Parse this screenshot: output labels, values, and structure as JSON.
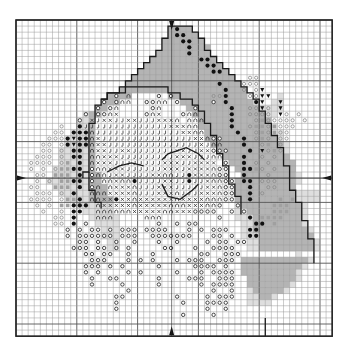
{
  "chart": {
    "cols": 52,
    "rows": 52,
    "origin_x": 16,
    "origin_y": 20,
    "cell": 6.08,
    "center_col": 25.6,
    "center_row": 26,
    "colors": {
      "background": "#ffffff",
      "grid_line": "#9a9a9a",
      "grid_major": "#555555",
      "border": "#222222",
      "dark_fill": "#b4b4b4",
      "light_fill": "#dedede",
      "symbol": "#333333",
      "light_symbol": "#8a8a8a",
      "outline": "#1a1a1a"
    },
    "legend_symbols": [
      {
        "key": "o",
        "name": "circle-stitch"
      },
      {
        "key": "n",
        "name": "arch-stitch"
      },
      {
        "key": "x",
        "name": "cross-stitch"
      },
      {
        "key": "j",
        "name": "hook-stitch"
      },
      {
        "key": "*",
        "name": "filled-dot-stitch"
      },
      {
        "key": "v",
        "name": "triangle-stitch"
      },
      {
        "key": "s",
        "name": "light-circle-stitch"
      },
      {
        "key": "q",
        "name": "grey-square-stitch"
      }
    ],
    "fill_rows": [
      "....................................................",
      ".........................GGGG.......................",
      ".........................GGGGG......................",
      "........................GGGGGGG.....................",
      "........................GGGGGGGG....................",
      ".......................GGGGGGGGG....................",
      "......................GGGGGGGGGGG...................",
      ".....................GGGGGGGGGGGGG..................",
      "....................GGGGGGGGGGGGGGG.................",
      "...................GGGGGGGGGGGGGGGGG................",
      "..................GGGGGGGGGGGGGGGGGGG...............",
      ".................GGGGGGGGGGGGGGGGGGGGG..............",
      "...............GGGG......GGGGGGGGGGGGG.....g........",
      "..............GGG..........GGGGGGGGGGGGg..gg........",
      ".............GG.............GGGGGGGGGGGGgggg........",
      "...........gGG...............GGGGGGGGGGGGgg.........",
      "..........ggG.................GGGGGGGGGGGG..........",
      "..........ggG.................GGGGGGGGGGGGg.........",
      ".........gggG..................GGGGGGGGGGGgg........",
      "........ggggG..................GGGGGGGGGGGGg........",
      "........ggggG...................GGGGGGGGGGGGg.......",
      ".......gggggG....................GGGGGGGGGGGg.......",
      ".......gggggG.....................GGGGGGGGGGG.......",
      ".......gggggG......................GGGGGGGGGGG......",
      "......ggggggG.......................GGGGGGGGGG......",
      "......ggggggGG.......................GGGGGGGGGg.....",
      ".....gggggggGG......................GGGGGGGGGGg.....",
      "......ggggggGGG.....................GGGGGGGGGG......",
      ".......gggggGGG.....................GGGGGGGGGGgggg..",
      "........ggggGGGG....................GGGGGGGGGGgggg..",
      "..........gggggg....................gGGGGGGGGGGg....",
      "...........ggggg....................ggGGGGGGGGGg....",
      "............ggggg...................gggGGGGGGGGg....",
      ".............gggg....................ggGGGGGGGGg....",
      "..............ggg....................ggGGGGGGGGGg...",
      "..............ggg....................gggGGGGGGGGG...",
      "...............gg.....................ggGGGGGGGGGg..",
      "...............gg.....................ggGGGGGGGGGg..",
      "..............................................g.....",
      ".....................................GGGGGGGGGGGg...",
      ".....................................GGGGGGGGGGg....",
      ".....................................GGGGGGGGGg.....",
      "......................................GGGGGGGGg.....",
      "......................................GGGGGGGg......",
      "......................................gGGGGGg.......",
      "......................................ggGGg.........",
      "......................................gggg..........",
      "....................................................",
      "....................................................",
      "....................................................",
      "....................................................",
      "...................................................."
    ],
    "symbol_rows": [
      "....................................................",
      "..........................*.........................",
      "..........................**........................",
      "...........................**.......................",
      "............................*.......................",
      "............................*.......................",
      "..............................**....................",
      "...............................**...................",
      "................................**..................",
      "......................................ss............",
      ".................................*...sss............",
      "..................................*..s.sv...........",
      "................o.n....o.o......ss*...ssvv..........",
      "..............o.onn..oonn.o.....o.*....*v..v........",
      ".............o.on.....on.....o.....*..ssvs.v........",
      "...........o.oonx....onx...onn.....*..ssss.vs.s.....",
      "..........o.xjxxjjxxjjjxxxn.nnn....*...sqsssss.s....",
      ".......s..*jjjjjjjjjjjjjjxxxnn.....*..sqqsqsss......",
      "......ss.***njjjjjjjjjjjjjjxxnn.....*..sqsqss.......",
      ".....sss*v**nxjjjjjjjjjjjjjjjxxnoo...*.sqs.ss.......",
      "....ss.s*v**nxxjjjjjjjjjjjjjjjxjnn...*..sq.s.......",
      "....ss.s.**.nxxjjxxjjjjjjjxxjjxxooo...*.vsqs........",
      "...sss.s.**.nnxxxjjjjjjjjjxxxjjjnn...*..s.s.........",
      "..ssss.sq.*.nxxxjjjjjjjjxxxjjxxxx.o..*.s.s.........",
      "..s.s.sqq**.onnxxxjjjjjjxxxjxxxxnoo..**qs.s........",
      "...ss.qqq.*.onnjxxjjjjxxnnjj*xxxnoo..*...s.........",
      "...s.s.qq**.o.nnxnn*jjjjxxjj*jjxnnoo.**.sss........",
      "..ss..qqq.*.on.nxxxnjjjxxxjjjjjxxnoo..*..ss.........",
      "...sss.s.*..nnnxxxxnjjjxxxnjjjxxxnoo..*.s..........",
      "..ssss.sqq*.nnxx*xxnxxxxxxnxxxxnnnoo..*....q.q.....",
      "...s.s.qq***.nxxxxxnxxxxxnnnxxxnno..o.....qqq.....",
      "....s..s.**..nnnnnnxxxxxnnxxxoooo..o.o....qqq.....",
      "......ss.*...nnn.....nnn.........o....*.qqqq......",
      "......ss.*.o...........o..o.oo.........**.q.......",
      "........o.o.oo.o.ooo.oooo...o.o.ooo...**..........",
      "........o.oooooo.ooo..ooooooo...oo.o..**.........",
      "..........oo.o..o..o...o..o....o.oo.oo..........",
      ".........ooo.oo.o.o.....oo...o..oooo...........",
      "...........oo.oo..o...o.......oo..ooo..........",
      "............ooo...o.o.o...o.ooo..ooo..........",
      "...........ooo.o.o.....o.....oooo.o...........",
      "...........o.o....o.o.....o...o.oooo..........",
      "............o..oo......o....ooo..ooo..........",
      "............o....o.....o......o.oooo..........",
      "..................o.............o..o..........",
      "................oo........o....o.ooo..........",
      "................o..........o...oooo...........",
      "................o..............o..o...........",
      "...........................o....o.............",
      "....................................................",
      "....................................................",
      "...................................................."
    ],
    "outlines": [
      {
        "name": "hat-outline",
        "points": [
          [
            11,
            26
          ],
          [
            11,
            25
          ],
          [
            12,
            25
          ],
          [
            12,
            17
          ],
          [
            13,
            17
          ],
          [
            13,
            14
          ],
          [
            14,
            14
          ],
          [
            14,
            13
          ],
          [
            15,
            13
          ],
          [
            15,
            12
          ],
          [
            17,
            12
          ],
          [
            17,
            11
          ],
          [
            18,
            11
          ],
          [
            18,
            10
          ],
          [
            19,
            10
          ],
          [
            19,
            9
          ],
          [
            20,
            9
          ],
          [
            20,
            8
          ],
          [
            21,
            8
          ],
          [
            21,
            7
          ],
          [
            22,
            7
          ],
          [
            22,
            6
          ],
          [
            23,
            6
          ],
          [
            23,
            5
          ],
          [
            24,
            5
          ],
          [
            24,
            3
          ],
          [
            25,
            3
          ],
          [
            25,
            1
          ],
          [
            29,
            1
          ],
          [
            29,
            2
          ],
          [
            30,
            2
          ],
          [
            30,
            3
          ],
          [
            31,
            3
          ],
          [
            31,
            5
          ],
          [
            32,
            5
          ],
          [
            32,
            6
          ],
          [
            33,
            6
          ],
          [
            33,
            7
          ],
          [
            34,
            7
          ],
          [
            34,
            8
          ],
          [
            35,
            8
          ],
          [
            35,
            9
          ],
          [
            36,
            9
          ],
          [
            36,
            10
          ],
          [
            37,
            10
          ],
          [
            37,
            11
          ],
          [
            38,
            11
          ],
          [
            38,
            12
          ],
          [
            39,
            12
          ],
          [
            39,
            13
          ],
          [
            40,
            13
          ],
          [
            40,
            15
          ],
          [
            41,
            15
          ],
          [
            41,
            17
          ],
          [
            42,
            17
          ],
          [
            42,
            19
          ],
          [
            43,
            19
          ],
          [
            43,
            21
          ],
          [
            44,
            21
          ],
          [
            44,
            24
          ],
          [
            45,
            24
          ],
          [
            45,
            28
          ],
          [
            46,
            28
          ],
          [
            46,
            30
          ],
          [
            47,
            30
          ],
          [
            47,
            33
          ],
          [
            48,
            33
          ],
          [
            48,
            36
          ],
          [
            49,
            36
          ],
          [
            49,
            40
          ]
        ]
      },
      {
        "name": "face-outline",
        "points": [
          [
            14,
            13
          ],
          [
            15,
            13
          ],
          [
            15,
            12
          ],
          [
            18,
            12
          ],
          [
            18,
            11
          ],
          [
            25,
            11
          ],
          [
            25,
            12
          ],
          [
            27,
            12
          ],
          [
            27,
            13
          ],
          [
            29,
            13
          ],
          [
            29,
            14
          ],
          [
            30,
            14
          ],
          [
            30,
            15
          ],
          [
            31,
            15
          ],
          [
            31,
            17
          ],
          [
            32,
            17
          ],
          [
            32,
            19
          ],
          [
            33,
            19
          ],
          [
            33,
            22
          ],
          [
            34,
            22
          ],
          [
            34,
            24
          ],
          [
            35,
            24
          ],
          [
            35,
            27
          ],
          [
            36,
            27
          ],
          [
            36,
            29
          ],
          [
            37,
            29
          ],
          [
            37,
            32
          ]
        ]
      },
      {
        "name": "beard-outline",
        "points": [
          [
            12,
            25
          ],
          [
            12,
            28
          ],
          [
            13,
            28
          ],
          [
            13,
            30
          ],
          [
            14,
            30
          ],
          [
            14,
            31
          ]
        ]
      },
      {
        "name": "right-eyebrow",
        "points": [
          [
            24,
            23
          ],
          [
            25,
            22
          ],
          [
            28,
            21
          ],
          [
            30,
            22
          ],
          [
            31,
            23
          ]
        ]
      },
      {
        "name": "left-eyebrow",
        "points": [
          [
            15,
            25
          ],
          [
            17,
            24
          ],
          [
            19,
            23.5
          ],
          [
            21,
            24
          ]
        ]
      },
      {
        "name": "mouth-outline",
        "points": [
          [
            24,
            27
          ],
          [
            25,
            29
          ],
          [
            27,
            29.5
          ],
          [
            29,
            28
          ],
          [
            30,
            27
          ]
        ]
      },
      {
        "name": "right-side-line",
        "points": [
          [
            41,
            49
          ],
          [
            41,
            52
          ]
        ]
      }
    ]
  }
}
